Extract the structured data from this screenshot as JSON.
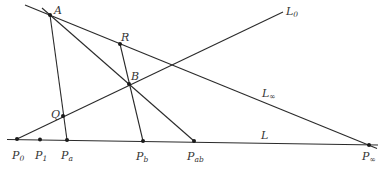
{
  "diagram": {
    "type": "projective-geometry-construction",
    "points": {
      "A": {
        "label": "A"
      },
      "B": {
        "label": "B"
      },
      "R": {
        "label": "R"
      },
      "Q": {
        "label": "Q"
      },
      "P0": {
        "label": "P",
        "sub": "0"
      },
      "P1": {
        "label": "P",
        "sub": "1"
      },
      "Pa": {
        "label": "P",
        "sub": "a"
      },
      "Pb": {
        "label": "P",
        "sub": "b"
      },
      "Pab": {
        "label": "P",
        "sub": "ab"
      },
      "Pinf": {
        "label": "P",
        "sub": "∞"
      }
    },
    "lines": {
      "L0": {
        "label": "L",
        "sub": "0"
      },
      "Linf": {
        "label": "L",
        "sub": "∞"
      },
      "L": {
        "label": "L",
        "sub": ""
      }
    },
    "colors": {
      "stroke": "#2a2a2a",
      "point": "#1a1a1a",
      "text": "#333333"
    }
  }
}
